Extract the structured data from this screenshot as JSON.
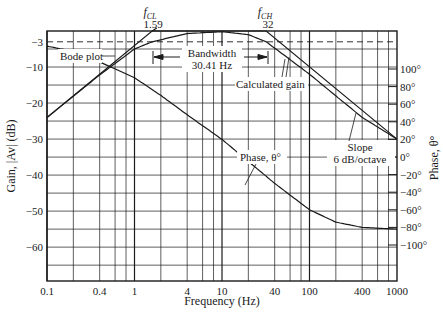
{
  "chart_data": {
    "type": "line",
    "title": "",
    "xlabel": "Frequency (Hz)",
    "ylabel": "Gain, |Av| (dB)",
    "y2label": "Phase, θ°",
    "xscale": "log",
    "xlim": [
      0.1,
      1000
    ],
    "ylim": [
      -69.4,
      0
    ],
    "y2lim": [
      -142,
      177
    ],
    "grid": true,
    "x_ticks": [
      0.1,
      0.4,
      1,
      4,
      10,
      40,
      100,
      400,
      1000
    ],
    "x_tick_labels": [
      "0.1",
      "0.4",
      "1",
      "4",
      "10",
      "40",
      "100",
      "400",
      "1000"
    ],
    "y_ticks": [
      -3,
      -10,
      -20,
      -30,
      -40,
      -50,
      -60
    ],
    "y_tick_labels": [
      "−3",
      "−10",
      "−20",
      "−30",
      "−40",
      "−50",
      "−60"
    ],
    "y2_ticks": [
      100,
      80,
      60,
      40,
      20,
      0,
      -20,
      -40,
      -60,
      -80,
      -100
    ],
    "y2_tick_labels": [
      "100°",
      "80°",
      "60°",
      "40°",
      "20°",
      "0°",
      "−20°",
      "−40°",
      "−60°",
      "−80°",
      "−100°"
    ],
    "series": [
      {
        "name": "Bode plot",
        "axis": "gain",
        "x": [
          0.1,
          1.59,
          32,
          1000
        ],
        "values": [
          -24,
          0,
          0,
          -30
        ]
      },
      {
        "name": "Calculated gain",
        "axis": "gain",
        "x": [
          0.1,
          0.4,
          1,
          1.59,
          4,
          10,
          20,
          32,
          50,
          100,
          400,
          1000
        ],
        "values": [
          -24,
          -12.2,
          -5,
          -3,
          -0.7,
          -0.2,
          -1,
          -3,
          -6.5,
          -12,
          -24,
          -30
        ]
      },
      {
        "name": "Phase, θ°",
        "axis": "phase",
        "x": [
          0.1,
          0.2,
          0.4,
          1,
          2,
          4,
          10,
          20,
          40,
          100,
          200,
          400,
          1000
        ],
        "values": [
          126,
          120,
          108,
          90,
          70,
          48,
          20,
          -5,
          -30,
          -60,
          -74,
          -80,
          -82
        ]
      }
    ],
    "reference_lines": [
      {
        "type": "horizontal",
        "axis": "gain",
        "value": -3,
        "style": "dashed"
      }
    ],
    "annotations": [
      {
        "label": "f_CL",
        "value": "1.59"
      },
      {
        "label": "f_CH",
        "value": "32"
      },
      {
        "label": "Bandwidth",
        "value": "30.41 Hz"
      },
      {
        "label": "Bode plot"
      },
      {
        "label": "Calculated gain"
      },
      {
        "label": "Phase, θ°"
      },
      {
        "label": "Slope",
        "value": "6 dB/octave"
      }
    ],
    "legend": "none (inline annotations)"
  },
  "labels": {
    "fcl_symbol": "f",
    "fcl_sub": "CL",
    "fcl_value": "1.59",
    "fch_symbol": "f",
    "fch_sub": "CH",
    "fch_value": "32",
    "bode": "Bode plot",
    "bandwidth": "Bandwidth",
    "bandwidth_value": "30.41 Hz",
    "calc_gain": "Calculated gain",
    "phase": "Phase, θ°",
    "slope": "Slope",
    "slope_value": "6 dB/octave",
    "xlabel": "Frequency (Hz)",
    "ylabel": "Gain, |Av| (dB)",
    "y2label": "Phase, θ°"
  }
}
